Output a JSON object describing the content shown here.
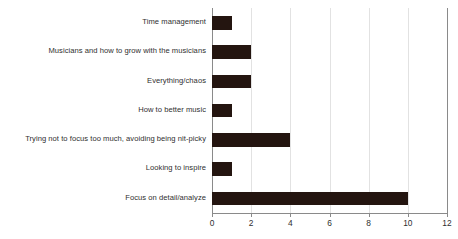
{
  "chart_data": {
    "type": "bar",
    "orientation": "horizontal",
    "title": "",
    "xlabel": "",
    "ylabel": "",
    "categories": [
      "Time management",
      "Musicians and how to grow with the musicians",
      "Everything/chaos",
      "How to better music",
      "Trying not to focus too much, avoiding being nit-picky",
      "Looking to inspire",
      "Focus on detail/analyze"
    ],
    "values": [
      1,
      2,
      2,
      1,
      4,
      1,
      10
    ],
    "xlim": [
      0,
      12
    ],
    "xticks": [
      0,
      2,
      4,
      6,
      8,
      10,
      12
    ],
    "xtick_labels": [
      "0",
      "2",
      "4",
      "6",
      "8",
      "10",
      "12"
    ],
    "grid": "vertical",
    "legend": "none",
    "bar_color": "#241510",
    "gridline_color": "#e2e2e2",
    "axis_color": "#8a8a8a",
    "text_color": "#2f2f2f",
    "background_color": "#ffffff"
  }
}
